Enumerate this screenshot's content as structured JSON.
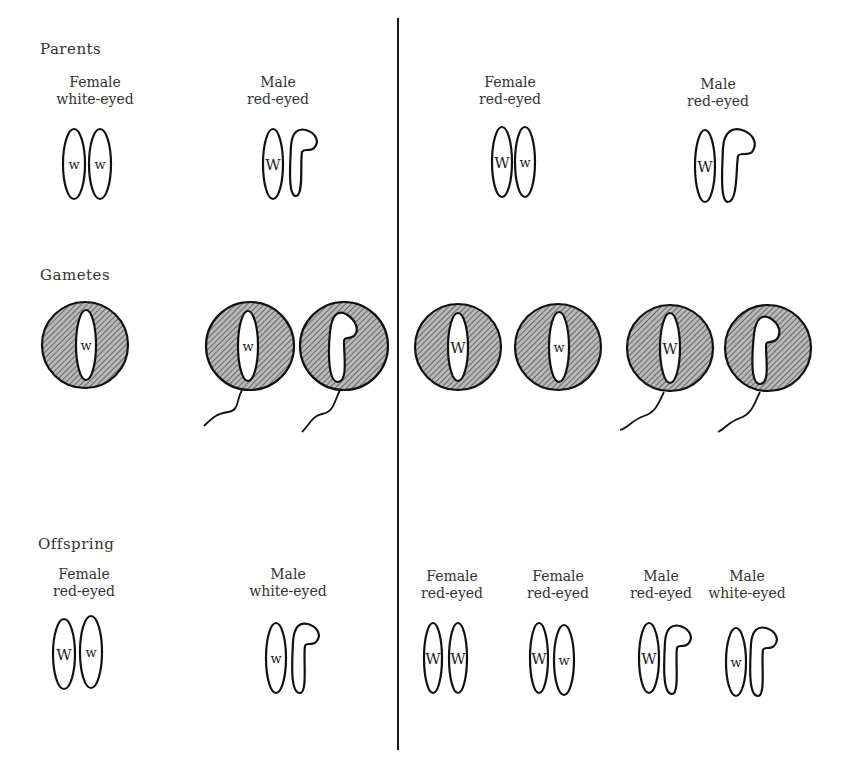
{
  "sections": {
    "parents": "Parents",
    "gametes": "Gametes",
    "offspring": "Offspring"
  },
  "left_cross": {
    "parents": [
      {
        "sex": "Female",
        "phenotype": "white-eyed",
        "chromosomes": [
          {
            "type": "X",
            "allele": "w"
          },
          {
            "type": "X",
            "allele": "w"
          }
        ]
      },
      {
        "sex": "Male",
        "phenotype": "red-eyed",
        "chromosomes": [
          {
            "type": "X",
            "allele": "W"
          },
          {
            "type": "Y",
            "allele": ""
          }
        ]
      }
    ],
    "gametes": [
      {
        "kind": "egg",
        "chromosome": "X",
        "allele": "w"
      },
      {
        "kind": "sperm",
        "chromosome": "X",
        "allele": "w"
      },
      {
        "kind": "sperm",
        "chromosome": "Y",
        "allele": ""
      }
    ],
    "offspring": [
      {
        "sex": "Female",
        "phenotype": "red-eyed",
        "chromosomes": [
          {
            "type": "X",
            "allele": "W"
          },
          {
            "type": "X",
            "allele": "w"
          }
        ]
      },
      {
        "sex": "Male",
        "phenotype": "white-eyed",
        "chromosomes": [
          {
            "type": "X",
            "allele": "w"
          },
          {
            "type": "Y",
            "allele": ""
          }
        ]
      }
    ]
  },
  "right_cross": {
    "parents": [
      {
        "sex": "Female",
        "phenotype": "red-eyed",
        "chromosomes": [
          {
            "type": "X",
            "allele": "W"
          },
          {
            "type": "X",
            "allele": "w"
          }
        ]
      },
      {
        "sex": "Male",
        "phenotype": "red-eyed",
        "chromosomes": [
          {
            "type": "X",
            "allele": "W"
          },
          {
            "type": "Y",
            "allele": ""
          }
        ]
      }
    ],
    "gametes": [
      {
        "kind": "egg",
        "chromosome": "X",
        "allele": "W"
      },
      {
        "kind": "egg",
        "chromosome": "X",
        "allele": "w"
      },
      {
        "kind": "sperm",
        "chromosome": "X",
        "allele": "W"
      },
      {
        "kind": "sperm",
        "chromosome": "Y",
        "allele": ""
      }
    ],
    "offspring": [
      {
        "sex": "Female",
        "phenotype": "red-eyed",
        "chromosomes": [
          {
            "type": "X",
            "allele": "W"
          },
          {
            "type": "X",
            "allele": "W"
          }
        ]
      },
      {
        "sex": "Female",
        "phenotype": "red-eyed",
        "chromosomes": [
          {
            "type": "X",
            "allele": "W"
          },
          {
            "type": "X",
            "allele": "w"
          }
        ]
      },
      {
        "sex": "Male",
        "phenotype": "red-eyed",
        "chromosomes": [
          {
            "type": "X",
            "allele": "W"
          },
          {
            "type": "Y",
            "allele": ""
          }
        ]
      },
      {
        "sex": "Male",
        "phenotype": "white-eyed",
        "chromosomes": [
          {
            "type": "X",
            "allele": "w"
          },
          {
            "type": "Y",
            "allele": ""
          }
        ]
      }
    ]
  },
  "colors": {
    "line": "#111111",
    "cell_fill": "#9a9a9a",
    "background": "#ffffff"
  }
}
